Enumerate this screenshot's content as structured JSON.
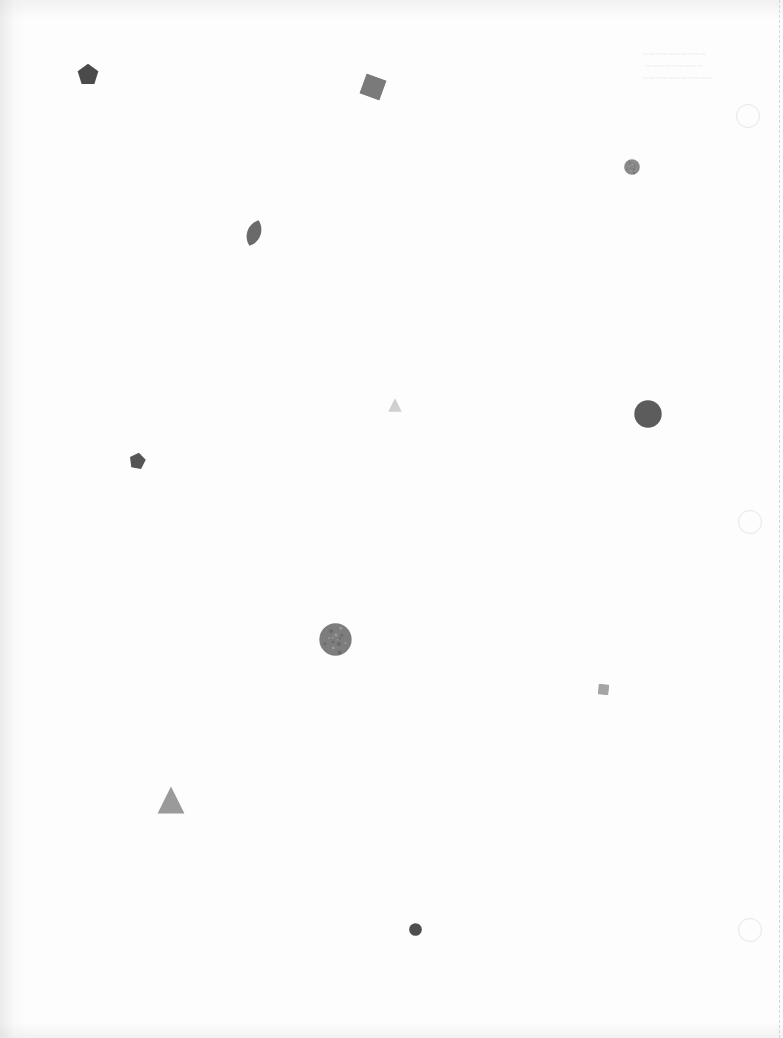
{
  "page": {
    "background": "#fdfdfd",
    "edge_shadow": "#d0d0d0"
  },
  "shapes": [
    {
      "id": "pentagon-1",
      "type": "pentagon",
      "x": 77,
      "y": 63,
      "size": 22,
      "color": "#4a4a4a",
      "rotation": 0
    },
    {
      "id": "square-1",
      "type": "square",
      "x": 362,
      "y": 76,
      "size": 22,
      "color": "#7a7a7a",
      "rotation": 20
    },
    {
      "id": "circle-small-1",
      "type": "circle",
      "x": 624,
      "y": 159,
      "size": 16,
      "color": "#8a8a8a",
      "texture": true
    },
    {
      "id": "leaf-1",
      "type": "leaf",
      "x": 244,
      "y": 219,
      "w": 20,
      "h": 28,
      "color": "#6a6a6a",
      "rotation": 20
    },
    {
      "id": "triangle-small-1",
      "type": "triangle",
      "x": 388,
      "y": 398,
      "size": 14,
      "color": "#cfcfcf"
    },
    {
      "id": "circle-large-1",
      "type": "circle",
      "x": 634,
      "y": 400,
      "size": 28,
      "color": "#5c5c5c",
      "texture": false
    },
    {
      "id": "pentagon-2",
      "type": "pentagon",
      "x": 129,
      "y": 452,
      "size": 17,
      "color": "#555555",
      "rotation": 10
    },
    {
      "id": "circle-textured-1",
      "type": "circle",
      "x": 319,
      "y": 623,
      "size": 33,
      "color": "#7d7d7d",
      "texture": true
    },
    {
      "id": "square-2",
      "type": "square",
      "x": 598,
      "y": 684,
      "size": 11,
      "color": "#a5a5a5",
      "rotation": 5
    },
    {
      "id": "triangle-large-1",
      "type": "triangle",
      "x": 157,
      "y": 786,
      "size": 28,
      "color": "#9a9a9a"
    },
    {
      "id": "circle-small-2",
      "type": "circle",
      "x": 409,
      "y": 923,
      "size": 13,
      "color": "#4e4e4e",
      "texture": false
    }
  ],
  "binder_holes": [
    {
      "x": 736,
      "y": 104
    },
    {
      "x": 738,
      "y": 510
    },
    {
      "x": 738,
      "y": 918
    }
  ],
  "bleed_through": [
    {
      "x": 642,
      "y": 48,
      "text": "~~~~~~~~~~\n ~~~~~~~~~\n~~~~~~~~~~~"
    }
  ]
}
